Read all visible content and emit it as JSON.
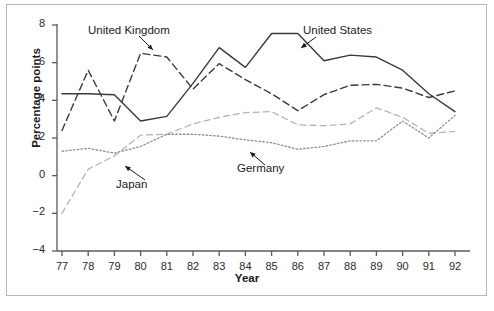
{
  "chart_data": {
    "type": "line",
    "title": "",
    "subtitle": "",
    "xlabel": "Year",
    "ylabel": "Percentage points",
    "x": [
      77,
      78,
      79,
      80,
      81,
      82,
      83,
      84,
      85,
      86,
      87,
      88,
      89,
      90,
      91,
      92
    ],
    "xtick_labels": [
      "77",
      "78",
      "79",
      "80",
      "81",
      "82",
      "83",
      "84",
      "85",
      "86",
      "87",
      "88",
      "89",
      "90",
      "91",
      "92"
    ],
    "ytick_labels": [
      "-4",
      "-2",
      "0",
      "2",
      "4",
      "6",
      "8"
    ],
    "ytick_values": [
      -4,
      -2,
      0,
      2,
      4,
      6,
      8
    ],
    "xlim": [
      76.6,
      92.6
    ],
    "ylim": [
      -4,
      8
    ],
    "grid": false,
    "legend": "annotations",
    "series": [
      {
        "name": "United States",
        "style": "solid",
        "color": "#3a3a3a",
        "values": [
          4.35,
          4.35,
          4.3,
          2.9,
          3.15,
          4.9,
          6.8,
          5.75,
          7.55,
          7.55,
          6.1,
          6.4,
          6.3,
          5.6,
          4.35,
          3.4
        ]
      },
      {
        "name": "United Kingdom",
        "style": "dashed",
        "color": "#3a3a3a",
        "values": [
          2.4,
          5.6,
          2.9,
          6.5,
          6.3,
          4.6,
          5.95,
          5.1,
          4.35,
          3.45,
          4.3,
          4.8,
          4.85,
          4.65,
          4.15,
          4.5
        ]
      },
      {
        "name": "Japan",
        "style": "dashed-light",
        "color": "#b5b5b5",
        "values": [
          -2.0,
          0.35,
          1.05,
          2.15,
          2.2,
          2.75,
          3.1,
          3.35,
          3.4,
          2.7,
          2.65,
          2.75,
          3.6,
          3.1,
          2.25,
          2.35
        ]
      },
      {
        "name": "Germany",
        "style": "dotted",
        "color": "#8f8f8f",
        "values": [
          1.3,
          1.45,
          1.2,
          1.55,
          2.2,
          2.2,
          2.1,
          1.9,
          1.75,
          1.4,
          1.55,
          1.85,
          1.85,
          2.9,
          2.0,
          3.2
        ]
      }
    ],
    "annotations": [
      {
        "text": "United Kingdom",
        "target_year": 80,
        "target_value": 6.5
      },
      {
        "text": "United States",
        "target_year": 86,
        "target_value": 7.55
      },
      {
        "text": "Japan",
        "target_year": 78.5,
        "target_value": 0.55
      },
      {
        "text": "Germany",
        "target_year": 86,
        "target_value": 1.5
      }
    ]
  }
}
